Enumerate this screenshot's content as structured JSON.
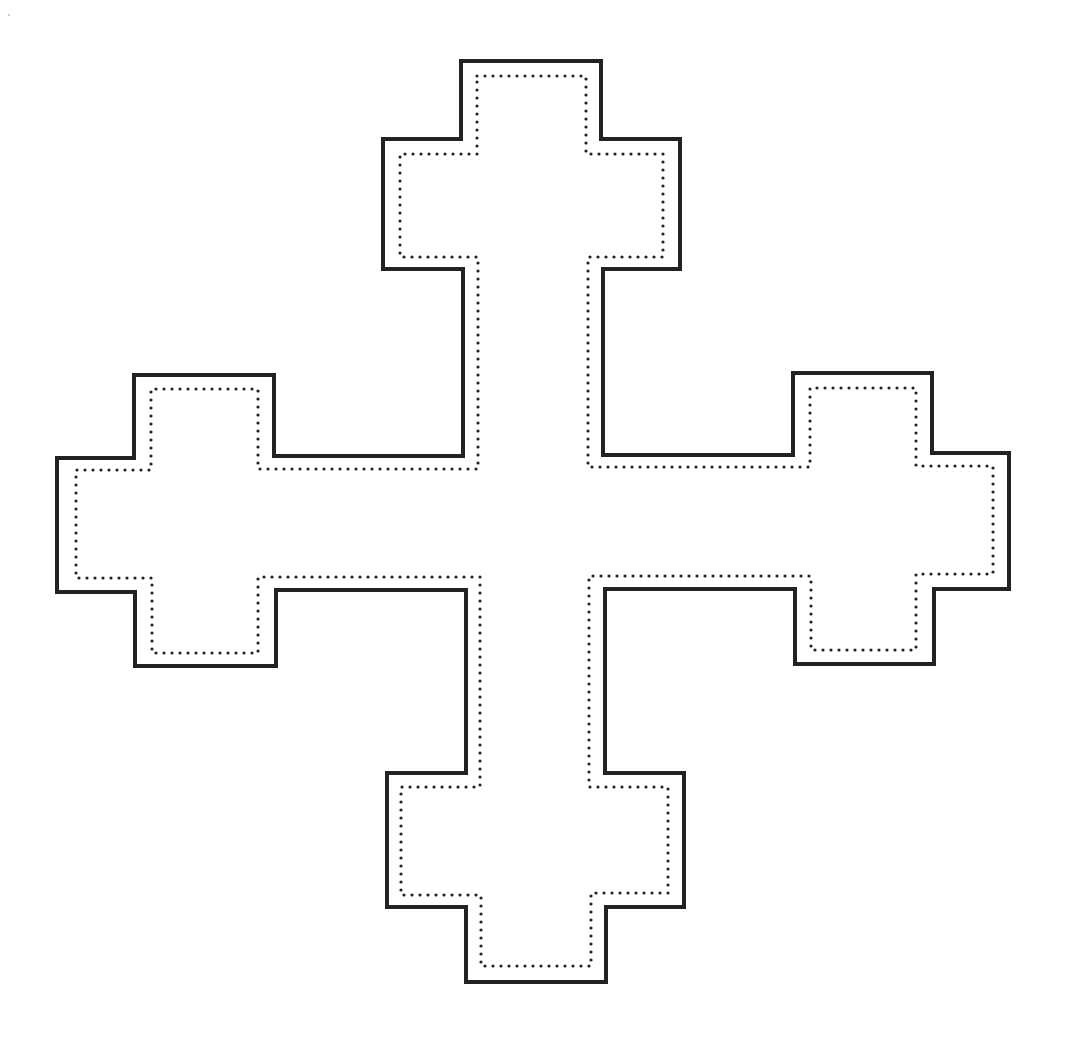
{
  "figure": {
    "background_color": "#ffffff",
    "stroke_color": "#222222"
  },
  "outer_outline": {
    "style": "solid",
    "stroke_width": 4,
    "points": [
      [
        461,
        61
      ],
      [
        601,
        61
      ],
      [
        601,
        139
      ],
      [
        680,
        139
      ],
      [
        680,
        269
      ],
      [
        603,
        269
      ],
      [
        603,
        455
      ],
      [
        793,
        455
      ],
      [
        793,
        373
      ],
      [
        932,
        373
      ],
      [
        932,
        453
      ],
      [
        1009,
        453
      ],
      [
        1009,
        589
      ],
      [
        934,
        589
      ],
      [
        934,
        664
      ],
      [
        795,
        664
      ],
      [
        795,
        589
      ],
      [
        605,
        589
      ],
      [
        605,
        773
      ],
      [
        684,
        773
      ],
      [
        684,
        907
      ],
      [
        606,
        907
      ],
      [
        606,
        982
      ],
      [
        466,
        982
      ],
      [
        466,
        907
      ],
      [
        387,
        907
      ],
      [
        387,
        773
      ],
      [
        466,
        773
      ],
      [
        466,
        590
      ],
      [
        276,
        590
      ],
      [
        276,
        666
      ],
      [
        135,
        666
      ],
      [
        135,
        592
      ],
      [
        57,
        592
      ],
      [
        57,
        458
      ],
      [
        134,
        458
      ],
      [
        134,
        375
      ],
      [
        274,
        375
      ],
      [
        274,
        456
      ],
      [
        463,
        456
      ],
      [
        463,
        269
      ],
      [
        383,
        269
      ],
      [
        383,
        139
      ],
      [
        461,
        139
      ]
    ]
  },
  "inner_outline": {
    "style": "dotted",
    "dot_radius": 1.6,
    "dot_spacing": 8,
    "points": [
      [
        477,
        76
      ],
      [
        586,
        76
      ],
      [
        586,
        154
      ],
      [
        663,
        154
      ],
      [
        663,
        257
      ],
      [
        588,
        257
      ],
      [
        588,
        467
      ],
      [
        810,
        467
      ],
      [
        810,
        388
      ],
      [
        916,
        388
      ],
      [
        916,
        466
      ],
      [
        993,
        466
      ],
      [
        993,
        574
      ],
      [
        916,
        574
      ],
      [
        916,
        650
      ],
      [
        811,
        650
      ],
      [
        811,
        576
      ],
      [
        589,
        576
      ],
      [
        589,
        787
      ],
      [
        668,
        787
      ],
      [
        668,
        893
      ],
      [
        591,
        893
      ],
      [
        591,
        966
      ],
      [
        481,
        966
      ],
      [
        481,
        895
      ],
      [
        401,
        895
      ],
      [
        401,
        787
      ],
      [
        480,
        787
      ],
      [
        480,
        577
      ],
      [
        258,
        577
      ],
      [
        258,
        653
      ],
      [
        152,
        653
      ],
      [
        152,
        578
      ],
      [
        76,
        578
      ],
      [
        76,
        470
      ],
      [
        151,
        470
      ],
      [
        151,
        389
      ],
      [
        258,
        389
      ],
      [
        258,
        469
      ],
      [
        478,
        469
      ],
      [
        478,
        257
      ],
      [
        400,
        257
      ],
      [
        400,
        154
      ],
      [
        477,
        154
      ]
    ]
  }
}
